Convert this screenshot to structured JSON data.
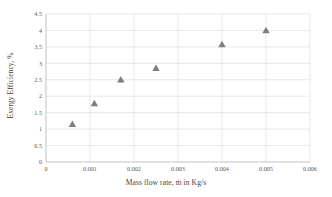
{
  "chart_data": {
    "type": "scatter",
    "title": "",
    "xlabel": "Mass flow rate, ṁ in Kg/s",
    "ylabel": "Exergy Efficiency, %",
    "xlim": [
      0,
      0.006
    ],
    "ylim": [
      0,
      4.5
    ],
    "grid": true,
    "legend": "none",
    "marker": {
      "shape": "triangle",
      "color": "#7f7f7f",
      "size": 6
    },
    "x_ticks": [
      "0",
      "0.001",
      "0.002",
      "0.003",
      "0.004",
      "0.005",
      "0.006"
    ],
    "x_tick_values": [
      0,
      0.001,
      0.002,
      0.003,
      0.004,
      0.005,
      0.006
    ],
    "y_ticks": [
      "0",
      "0.5",
      "1",
      "1.5",
      "2",
      "2.5",
      "3",
      "3.5",
      "4",
      "4.5"
    ],
    "y_tick_values": [
      0,
      0.5,
      1,
      1.5,
      2,
      2.5,
      3,
      3.5,
      4,
      4.5
    ],
    "series": [
      {
        "name": "Exergy Efficiency",
        "points": [
          {
            "x": 0.0006,
            "y": 1.15
          },
          {
            "x": 0.0011,
            "y": 1.78
          },
          {
            "x": 0.0017,
            "y": 2.5
          },
          {
            "x": 0.0025,
            "y": 2.85
          },
          {
            "x": 0.004,
            "y": 3.57
          },
          {
            "x": 0.005,
            "y": 4.0
          }
        ]
      }
    ],
    "x": [
      0.0006,
      0.0011,
      0.0017,
      0.0025,
      0.004,
      0.005
    ],
    "y": [
      1.15,
      1.78,
      2.5,
      2.85,
      3.57,
      4.0
    ]
  },
  "axes": {
    "x_title": "Mass flow rate, ṁ in Kg/s",
    "y_title": "Exergy Efficiency, %"
  }
}
